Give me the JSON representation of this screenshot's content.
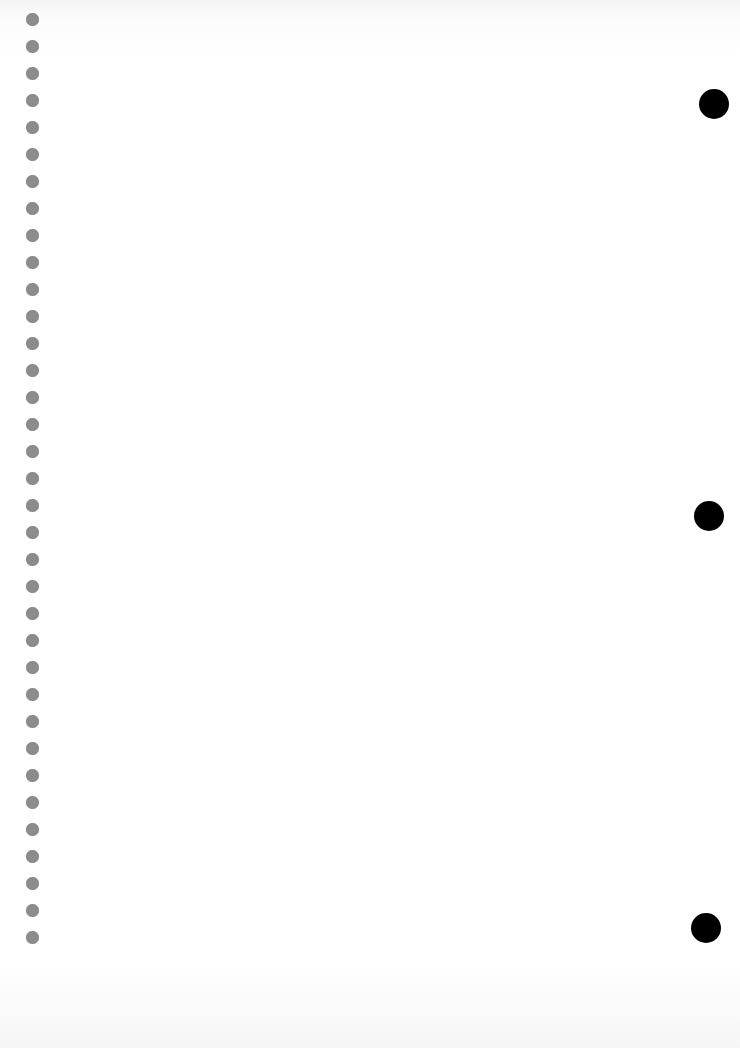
{
  "page": {
    "type": "blank notebook sheet",
    "background_color": "#ffffff",
    "spiral_holes": {
      "count": 35,
      "x": 32,
      "first_y": 19,
      "spacing": 27,
      "diameter": 13,
      "color": "#8c8c8c"
    },
    "punch_holes": [
      {
        "x": 714,
        "y": 104,
        "diameter": 30,
        "color": "#000000"
      },
      {
        "x": 709,
        "y": 516,
        "diameter": 30,
        "color": "#000000"
      },
      {
        "x": 706,
        "y": 928,
        "diameter": 30,
        "color": "#000000"
      }
    ]
  }
}
